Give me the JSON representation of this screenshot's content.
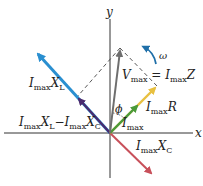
{
  "diagram": {
    "origin": [
      110,
      133
    ],
    "axes": {
      "x_label": "x",
      "y_label": "y"
    },
    "colors": {
      "axis": "#333333",
      "vmax": "#6e6e6e",
      "xl": "#2a8fd0",
      "xl_minus_xc": "#4a2a6e",
      "xc": "#c8505a",
      "r": "#e8c040",
      "i": "#4a9a3a",
      "omega": "#1f6fa8",
      "dashed": "#444444"
    },
    "phasors": [
      {
        "id": "vmax",
        "label_main": "V",
        "label_sub": "max",
        "label_eq": " = I",
        "label_sub2": "max",
        "label_tail": "Z",
        "end": [
          120,
          48
        ]
      },
      {
        "id": "xl",
        "label_main": "I",
        "label_sub": "max",
        "label_tail": "X",
        "label_sub2": "L",
        "end": [
          36,
          52
        ]
      },
      {
        "id": "xl_minus_xc",
        "label_main": "I",
        "label_sub": "max",
        "label_tail": "X",
        "label_sub2": "L",
        "label_minus": "−I",
        "label_sub3": "max",
        "label_tail2": "X",
        "label_sub4": "C",
        "end": [
          77,
          97
        ]
      },
      {
        "id": "xc",
        "label_main": "I",
        "label_sub": "max",
        "label_tail": "X",
        "label_sub2": "C",
        "end": [
          152,
          175
        ]
      },
      {
        "id": "r",
        "label_main": "I",
        "label_sub": "max",
        "label_tail": "R",
        "end": [
          157,
          86
        ]
      },
      {
        "id": "i",
        "label_main": "I",
        "label_sub": "max",
        "end": [
          138,
          105
        ]
      }
    ],
    "angle_label": "ϕ",
    "omega_label": "ω"
  }
}
